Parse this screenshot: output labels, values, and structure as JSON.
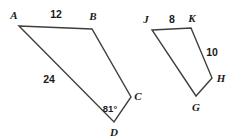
{
  "figure": {
    "background_color": "#ffffff",
    "stroke_color": "#3f3f3f",
    "text_color": "#1a1a1a",
    "stroke_width": 1.4,
    "width": 248,
    "height": 139,
    "shapes": [
      {
        "name": "quadrilateral-abcd",
        "vertices": [
          {
            "label": "A",
            "x": 19,
            "y": 26
          },
          {
            "label": "B",
            "x": 92,
            "y": 29
          },
          {
            "label": "C",
            "x": 131,
            "y": 97
          },
          {
            "label": "D",
            "x": 114,
            "y": 122
          }
        ],
        "closed": true
      },
      {
        "name": "quadrilateral-jkhg",
        "vertices": [
          {
            "label": "J",
            "x": 152,
            "y": 30
          },
          {
            "label": "K",
            "x": 191,
            "y": 28
          },
          {
            "label": "H",
            "x": 212,
            "y": 78
          },
          {
            "label": "G",
            "x": 196,
            "y": 96
          }
        ],
        "closed": true
      }
    ],
    "vertex_labels": [
      {
        "name": "vertex-label-a",
        "text": "A",
        "x": 14,
        "y": 15
      },
      {
        "name": "vertex-label-b",
        "text": "B",
        "x": 93,
        "y": 16
      },
      {
        "name": "vertex-label-c",
        "text": "C",
        "x": 138,
        "y": 96
      },
      {
        "name": "vertex-label-d",
        "text": "D",
        "x": 114,
        "y": 132
      },
      {
        "name": "vertex-label-j",
        "text": "J",
        "x": 146,
        "y": 19
      },
      {
        "name": "vertex-label-k",
        "text": "K",
        "x": 192,
        "y": 18
      },
      {
        "name": "vertex-label-h",
        "text": "H",
        "x": 221,
        "y": 78
      },
      {
        "name": "vertex-label-g",
        "text": "G",
        "x": 196,
        "y": 107
      }
    ],
    "measure_labels": [
      {
        "name": "side-length-ab",
        "text": "12",
        "x": 56,
        "y": 14
      },
      {
        "name": "side-length-ad",
        "text": "24",
        "x": 49,
        "y": 79
      },
      {
        "name": "side-length-jk",
        "text": "8",
        "x": 172,
        "y": 19
      },
      {
        "name": "side-length-kh",
        "text": "10",
        "x": 212,
        "y": 52
      }
    ],
    "angle_labels": [
      {
        "name": "angle-measure-d",
        "text": "81°",
        "x": 110,
        "y": 109
      }
    ]
  }
}
